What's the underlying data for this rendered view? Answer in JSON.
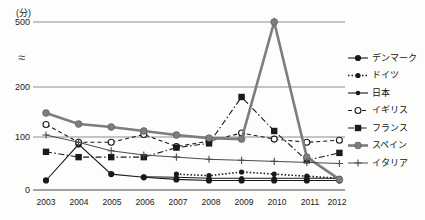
{
  "chart_data": {
    "type": "line",
    "title": "",
    "subtitle": "",
    "unit_label": "(分)",
    "xlabel": "",
    "ylabel": "",
    "x": [
      2003,
      2004,
      2005,
      2006,
      2007,
      2008,
      2009,
      2010,
      2011,
      2012
    ],
    "categories": [
      "2003",
      "2004",
      "2005",
      "2006",
      "2007",
      "2008",
      "2009",
      "2010",
      "2011",
      "2012"
    ],
    "ylim": [
      0,
      500
    ],
    "y_ticks": [
      "0",
      "100",
      "200",
      "≈",
      "500"
    ],
    "y_tick_values": [
      0,
      100,
      200,
      null,
      500
    ],
    "axis_break": true,
    "axis_break_symbol": "≈",
    "grid": true,
    "grid_axis": "y",
    "legend_position": "right",
    "series": [
      {
        "name": "デンマーク",
        "name_en": "Denmark",
        "marker": "filled-circle",
        "line": "solid",
        "color": "#1a1a1a",
        "values": [
          18,
          86,
          30,
          24,
          20,
          18,
          18,
          18,
          18,
          18
        ]
      },
      {
        "name": "ドイツ",
        "name_en": "Germany",
        "marker": "dotted-dense",
        "line": "dotted",
        "color": "#1a1a1a",
        "values": [
          null,
          null,
          null,
          null,
          30,
          27,
          34,
          30,
          26,
          22
        ]
      },
      {
        "name": "日本",
        "name_en": "Japan",
        "marker": "filled-circle-small",
        "line": "solid",
        "color": "#1a1a1a",
        "values": [
          null,
          null,
          null,
          25,
          24,
          22,
          22,
          22,
          22,
          22
        ]
      },
      {
        "name": "イギリス",
        "name_en": "United Kingdom",
        "marker": "open-circle",
        "line": "dashed",
        "color": "#1a1a1a",
        "values": [
          125,
          90,
          90,
          105,
          82,
          92,
          108,
          96,
          90,
          94
        ]
      },
      {
        "name": "フランス",
        "name_en": "France",
        "marker": "filled-square",
        "line": "dash-dot",
        "color": "#1a1a1a",
        "values": [
          72,
          62,
          62,
          62,
          80,
          88,
          180,
          112,
          56,
          70
        ]
      },
      {
        "name": "スペイン",
        "name_en": "Spain",
        "marker": "filled-circle-gray",
        "line": "solid-thick-gray",
        "color": "#7d7d7d",
        "values": [
          148,
          126,
          120,
          112,
          104,
          98,
          96,
          500,
          62,
          20
        ]
      },
      {
        "name": "イタリア",
        "name_en": "Italy",
        "marker": "plus",
        "line": "solid-thin",
        "color": "#4a4a4a",
        "values": [
          104,
          90,
          74,
          66,
          62,
          58,
          56,
          54,
          52,
          50
        ]
      }
    ]
  },
  "legend": {
    "items": [
      {
        "label": "デンマーク",
        "marker": "filled-circle"
      },
      {
        "label": "ドイツ",
        "marker": "dotted-dense"
      },
      {
        "label": "日本",
        "marker": "filled-circle-small"
      },
      {
        "label": "イギリス",
        "marker": "open-circle"
      },
      {
        "label": "フランス",
        "marker": "filled-square"
      },
      {
        "label": "スペイン",
        "marker": "filled-circle-gray"
      },
      {
        "label": "イタリア",
        "marker": "plus"
      }
    ]
  },
  "colors": {
    "ink": "#1a1a1a",
    "grid": "#8d8d8d",
    "gray_series": "#7d7d7d",
    "background": "#fdfdfb"
  }
}
